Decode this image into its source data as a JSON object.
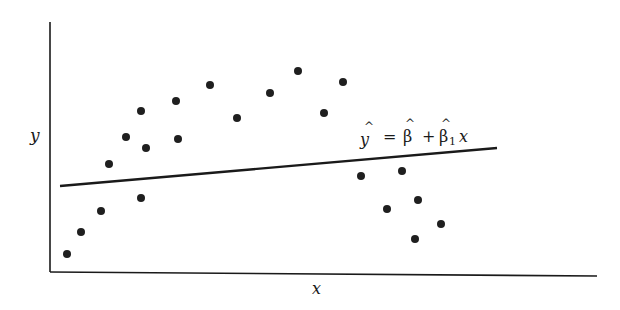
{
  "chart_data": {
    "type": "scatter",
    "title": "",
    "xlabel": "x",
    "ylabel": "y",
    "grid": false,
    "legend": null,
    "annotation": "ŷ = β̂ + β̂₁ x",
    "annotation_parts": {
      "yhat": "y",
      "eq": "=",
      "b0": "β",
      "plus": "+",
      "b1": "β",
      "sub": "1",
      "x": "x"
    },
    "points_px": [
      [
        67,
        254
      ],
      [
        81,
        232
      ],
      [
        101,
        211
      ],
      [
        109,
        164
      ],
      [
        126,
        137
      ],
      [
        141,
        111
      ],
      [
        146,
        148
      ],
      [
        141,
        198
      ],
      [
        176,
        101
      ],
      [
        178,
        139
      ],
      [
        210,
        85
      ],
      [
        237,
        118
      ],
      [
        270,
        93
      ],
      [
        298,
        71
      ],
      [
        324,
        113
      ],
      [
        343,
        82
      ],
      [
        361,
        176
      ],
      [
        402,
        171
      ],
      [
        387,
        209
      ],
      [
        418,
        200
      ],
      [
        415,
        239
      ],
      [
        441,
        224
      ]
    ],
    "fit_line_px": [
      [
        60,
        186
      ],
      [
        497,
        148
      ]
    ]
  }
}
